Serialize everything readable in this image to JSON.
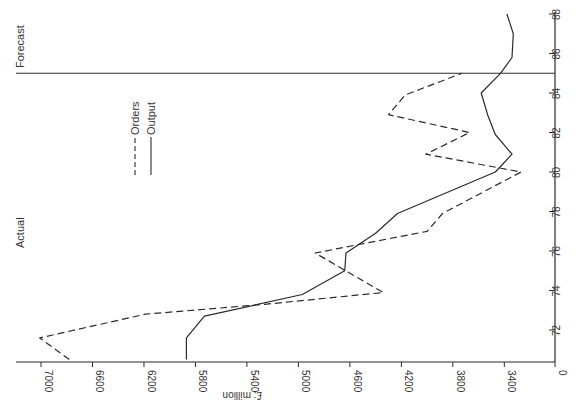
{
  "chart_data": {
    "type": "line",
    "orientation": "rotated 90deg (value axis horizontal at bottom, reversed; year axis vertical on right)",
    "title": "",
    "xlabel": "Year",
    "ylabel": "£: million",
    "value_axis": {
      "label": "£: million",
      "ticks": [
        7000,
        6600,
        6200,
        5800,
        5400,
        5000,
        4600,
        4200,
        3800,
        3400,
        0
      ],
      "range": [
        3200,
        7100
      ],
      "broken_axis_zero": true
    },
    "year_axis": {
      "ticks": [
        72,
        74,
        76,
        78,
        80,
        82,
        84,
        86,
        88
      ],
      "range": [
        70.5,
        88
      ]
    },
    "annotations": [
      {
        "text": "Actual",
        "region": "before 85"
      },
      {
        "text": "Forecast",
        "region": "after 85"
      }
    ],
    "divider_year": 85,
    "legend": [
      {
        "name": "Orders",
        "style": "dashed"
      },
      {
        "name": "Output",
        "style": "solid"
      }
    ],
    "series": [
      {
        "name": "Orders",
        "style": "dashed",
        "points": [
          [
            70.5,
            6780
          ],
          [
            71.6,
            7010
          ],
          [
            72.8,
            6190
          ],
          [
            73.3,
            5260
          ],
          [
            73.9,
            4340
          ],
          [
            75.9,
            4870
          ],
          [
            77.0,
            4000
          ],
          [
            77.9,
            3880
          ],
          [
            80.0,
            3270
          ],
          [
            80.9,
            4010
          ],
          [
            82.0,
            3670
          ],
          [
            82.9,
            4300
          ],
          [
            83.9,
            4170
          ],
          [
            85.0,
            3730
          ]
        ]
      },
      {
        "name": "Output",
        "style": "solid",
        "points": [
          [
            70.5,
            5870
          ],
          [
            71.6,
            5870
          ],
          [
            72.7,
            5730
          ],
          [
            73.8,
            4970
          ],
          [
            75.0,
            4640
          ],
          [
            75.9,
            4630
          ],
          [
            76.9,
            4400
          ],
          [
            77.9,
            4230
          ],
          [
            80.0,
            3470
          ],
          [
            80.9,
            3340
          ],
          [
            81.9,
            3470
          ],
          [
            82.9,
            3530
          ],
          [
            84.0,
            3580
          ],
          [
            85.0,
            3430
          ],
          [
            85.8,
            3340
          ],
          [
            87.0,
            3330
          ],
          [
            88.0,
            3380
          ]
        ]
      }
    ]
  },
  "labels": {
    "actual": "Actual",
    "forecast": "Forecast",
    "unit": "£: million",
    "legend_orders": "Orders",
    "legend_output": "Output"
  },
  "colors": {
    "line": "#2b2b2b",
    "text": "#333333",
    "background": "#ffffff"
  }
}
